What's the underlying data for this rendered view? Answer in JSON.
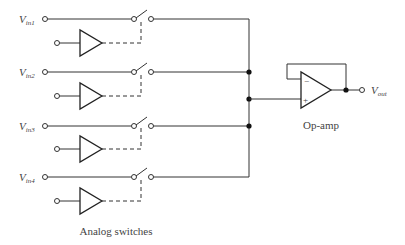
{
  "diagram": {
    "type": "circuit-schematic",
    "inputs": [
      {
        "label": "V",
        "sub": "in1"
      },
      {
        "label": "V",
        "sub": "in2"
      },
      {
        "label": "V",
        "sub": "in3"
      },
      {
        "label": "V",
        "sub": "in4"
      }
    ],
    "output": {
      "label": "V",
      "sub": "out"
    },
    "opamp_label": "Op-amp",
    "opamp_minus": "−",
    "opamp_plus": "+",
    "switches_label": "Analog switches"
  }
}
